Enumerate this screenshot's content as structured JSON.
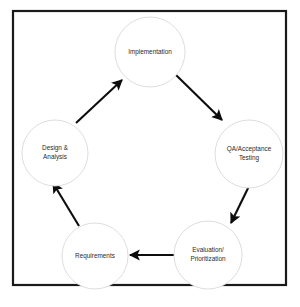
{
  "diagram": {
    "background_color": "#ffffff",
    "frame": {
      "name": "diagram-border",
      "x": 13,
      "y": 11,
      "width": 273,
      "height": 274,
      "stroke_color": "#1a1a1a",
      "stroke_width": 2.2
    },
    "node_style": {
      "fill_color": "#ffffff",
      "stroke_color": "#d9d9d9",
      "text_color": "#2b2b2b"
    },
    "arrow_color": "#0d0d0d",
    "nodes": [
      {
        "id": "implementation",
        "label": "Implementation",
        "lines": [
          "Implementation"
        ],
        "cx": 150,
        "cy": 52,
        "r": 35
      },
      {
        "id": "qa-acceptance-testing",
        "label": "QA/Acceptance Testing",
        "lines": [
          "QA/Acceptance",
          "Testing"
        ],
        "cx": 249,
        "cy": 154,
        "r": 34
      },
      {
        "id": "evaluation-prioritization",
        "label": "Evaluation/Prioritization",
        "lines": [
          "Evaluation/",
          "Prioritization"
        ],
        "cx": 208,
        "cy": 255,
        "r": 34
      },
      {
        "id": "requirements",
        "label": "Requirements",
        "lines": [
          "Requirements"
        ],
        "cx": 95,
        "cy": 256,
        "r": 33
      },
      {
        "id": "design-analysis",
        "label": "Design & Analysis",
        "lines": [
          "Design &",
          "Analysis"
        ],
        "cx": 55,
        "cy": 153,
        "r": 33
      }
    ],
    "edges": [
      {
        "id": "design-to-implementation",
        "from": "design-analysis",
        "to": "implementation",
        "x1": 76,
        "y1": 123,
        "x2": 122,
        "y2": 80
      },
      {
        "id": "implementation-to-qa",
        "from": "implementation",
        "to": "qa-acceptance-testing",
        "x1": 176,
        "y1": 75,
        "x2": 222,
        "y2": 120
      },
      {
        "id": "qa-to-evaluation",
        "from": "qa-acceptance-testing",
        "to": "evaluation-prioritization",
        "x1": 252,
        "y1": 180,
        "x2": 231,
        "y2": 223
      },
      {
        "id": "evaluation-to-requirements",
        "from": "evaluation-prioritization",
        "to": "requirements",
        "x1": 175,
        "y1": 255,
        "x2": 130,
        "y2": 255
      },
      {
        "id": "requirements-to-design",
        "from": "requirements",
        "to": "design-analysis",
        "x1": 79,
        "y1": 226,
        "x2": 53,
        "y2": 183
      }
    ]
  }
}
